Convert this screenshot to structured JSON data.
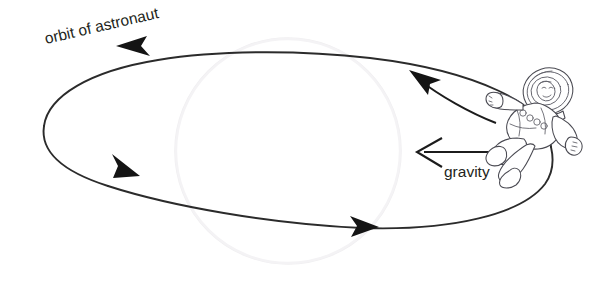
{
  "figure": {
    "background_color": "#ffffff",
    "width": 603,
    "height": 294
  },
  "labels": {
    "orbit_label": "orbit of astronaut",
    "gravity_label": "gravity"
  },
  "elements": {
    "orbit_path_name": "orbit-ellipse",
    "planet_name": "planet-circle",
    "astronaut_name": "astronaut-figure",
    "velocity_arrow_name": "velocity-arrow",
    "gravity_arrow_name": "gravity-arrow"
  },
  "colors": {
    "ink": "#2b2b2b",
    "arrowhead": "#141414",
    "planet_outline": "#f0eff1",
    "astronaut_outline": "#4a4a52",
    "text": "#231f20",
    "background": "#ffffff"
  },
  "geometry": {
    "orbit_center_x": 290,
    "orbit_center_y": 148,
    "orbit_rx": 258,
    "orbit_ry": 95,
    "orbit_tilt_deg": -10,
    "planet_center_x": 288,
    "planet_center_y": 151,
    "planet_radius": 113,
    "orbit_label_rotation_deg": -13,
    "orbit_label_x": 46,
    "orbit_label_y": 44,
    "gravity_label_x": 444,
    "gravity_label_y": 176,
    "gravity_arrow_tail_x": 512,
    "gravity_arrow_tip_x": 415,
    "gravity_arrow_y": 152,
    "velocity_arrow_tail_x": 494,
    "velocity_arrow_tail_y": 122,
    "velocity_arrow_tip_x": 411,
    "velocity_arrow_tip_y": 70,
    "arrowhead_positions": [
      {
        "name": "arrowhead-top",
        "x": 118,
        "y": 46,
        "direction": "left"
      },
      {
        "name": "arrowhead-left",
        "x": 124,
        "y": 168,
        "direction": "down-right"
      },
      {
        "name": "arrowhead-bottom",
        "x": 367,
        "y": 226,
        "direction": "right"
      }
    ],
    "astronaut_x": 490,
    "astronaut_y": 62,
    "astronaut_w": 105,
    "astronaut_h": 105
  }
}
